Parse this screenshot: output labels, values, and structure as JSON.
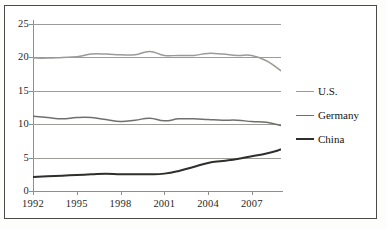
{
  "chart_data": {
    "type": "line",
    "title": "",
    "subtitle": "",
    "xlabel": "",
    "ylabel": "",
    "xlim": [
      1992,
      2009
    ],
    "ylim": [
      0,
      25
    ],
    "grid": true,
    "grid_axis": "y",
    "legend_position": "right",
    "x": [
      1992,
      1993,
      1994,
      1995,
      1996,
      1997,
      1998,
      1999,
      2000,
      2001,
      2002,
      2003,
      2004,
      2005,
      2006,
      2007,
      2008,
      2009
    ],
    "xticks": [
      1992,
      1995,
      1998,
      2001,
      2004,
      2007
    ],
    "xtick_labels": [
      "1992",
      "1995",
      "1998",
      "2001",
      "2004",
      "2007"
    ],
    "yticks": [
      0,
      5,
      10,
      15,
      20,
      25
    ],
    "ytick_labels": [
      "0",
      "5",
      "10",
      "15",
      "20",
      "25"
    ],
    "series": [
      {
        "name": "U.S.",
        "color": "#9a9a96",
        "width": 1.5,
        "values": [
          19.9,
          19.9,
          20.0,
          20.1,
          20.5,
          20.5,
          20.4,
          20.4,
          20.9,
          20.3,
          20.3,
          20.3,
          20.6,
          20.5,
          20.3,
          20.3,
          19.5,
          18.0
        ]
      },
      {
        "name": "Germany",
        "color": "#6f6f6b",
        "width": 1.5,
        "values": [
          11.2,
          11.0,
          10.8,
          11.0,
          11.0,
          10.7,
          10.4,
          10.6,
          10.9,
          10.5,
          10.8,
          10.8,
          10.7,
          10.6,
          10.6,
          10.4,
          10.3,
          9.8
        ]
      },
      {
        "name": "China",
        "color": "#2e2e2c",
        "width": 2.0,
        "values": [
          2.1,
          2.2,
          2.3,
          2.4,
          2.5,
          2.6,
          2.5,
          2.5,
          2.5,
          2.6,
          3.0,
          3.6,
          4.2,
          4.5,
          4.8,
          5.2,
          5.6,
          6.2
        ]
      }
    ]
  },
  "legend": {
    "items": [
      {
        "label": "U.S.",
        "color": "#9a9a96"
      },
      {
        "label": "Germany",
        "color": "#6f6f6b"
      },
      {
        "label": "China",
        "color": "#2e2e2c"
      }
    ]
  },
  "style": {
    "gridline_color": "#9b9b97",
    "axis_color": "#8e8e8a",
    "frame_color": "#4a4a48",
    "background": "#ffffff"
  }
}
